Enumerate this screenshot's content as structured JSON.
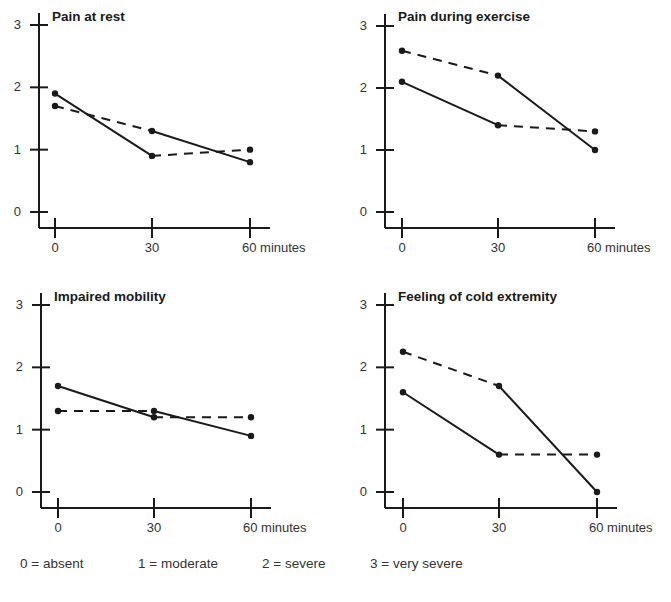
{
  "chart_data": [
    {
      "type": "line",
      "title": "Pain at rest",
      "x": [
        0,
        30,
        60
      ],
      "xtick_labels": [
        "0",
        "30",
        "60 minutes"
      ],
      "xlabel": "minutes",
      "ylabel": "",
      "yticks": [
        0,
        1,
        2,
        3
      ],
      "ylim": [
        0,
        3
      ],
      "grid": false,
      "series": [
        {
          "name": "A",
          "values": [
            1.9,
            0.9,
            1.0
          ],
          "segment_styles": [
            "solid",
            "dashed"
          ]
        },
        {
          "name": "B",
          "values": [
            1.7,
            1.3,
            0.8
          ],
          "segment_styles": [
            "dashed",
            "solid"
          ]
        }
      ]
    },
    {
      "type": "line",
      "title": "Pain during exercise",
      "x": [
        0,
        30,
        60
      ],
      "xtick_labels": [
        "0",
        "30",
        "60 minutes"
      ],
      "xlabel": "minutes",
      "ylabel": "",
      "yticks": [
        0,
        1,
        2,
        3
      ],
      "ylim": [
        0,
        3
      ],
      "grid": false,
      "series": [
        {
          "name": "A",
          "values": [
            2.6,
            2.2,
            1.0
          ],
          "segment_styles": [
            "dashed",
            "solid"
          ]
        },
        {
          "name": "B",
          "values": [
            2.1,
            1.4,
            1.3
          ],
          "segment_styles": [
            "solid",
            "dashed"
          ]
        }
      ]
    },
    {
      "type": "line",
      "title": "Impaired mobility",
      "x": [
        0,
        30,
        60
      ],
      "xtick_labels": [
        "0",
        "30",
        "60 minutes"
      ],
      "xlabel": "minutes",
      "ylabel": "",
      "yticks": [
        0,
        1,
        2,
        3
      ],
      "ylim": [
        0,
        3
      ],
      "grid": false,
      "series": [
        {
          "name": "A",
          "values": [
            1.7,
            1.2,
            1.2
          ],
          "segment_styles": [
            "solid",
            "dashed"
          ]
        },
        {
          "name": "B",
          "values": [
            1.3,
            1.3,
            0.9
          ],
          "segment_styles": [
            "dashed",
            "solid"
          ]
        }
      ]
    },
    {
      "type": "line",
      "title": "Feeling of cold extremity",
      "x": [
        0,
        30,
        60
      ],
      "xtick_labels": [
        "0",
        "30",
        "60 minutes"
      ],
      "xlabel": "minutes",
      "ylabel": "",
      "yticks": [
        0,
        1,
        2,
        3
      ],
      "ylim": [
        0,
        3
      ],
      "grid": false,
      "series": [
        {
          "name": "A",
          "values": [
            2.25,
            1.7,
            0.0
          ],
          "segment_styles": [
            "dashed",
            "solid"
          ]
        },
        {
          "name": "B",
          "values": [
            1.6,
            0.6,
            0.6
          ],
          "segment_styles": [
            "solid",
            "dashed"
          ]
        }
      ]
    }
  ],
  "legend": {
    "items": [
      "0 = absent",
      "1 = moderate",
      "2 = severe",
      "3 = very severe"
    ]
  },
  "colors": {
    "line": "#1a1a1a",
    "text": "#333333"
  }
}
